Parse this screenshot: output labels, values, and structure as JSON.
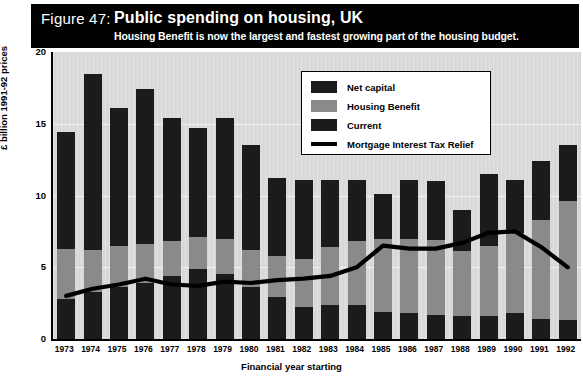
{
  "header": {
    "figure_label": "Figure 47:",
    "title": "Public spending on housing, UK",
    "subtitle": "Housing Benefit is now the largest and fastest growing part of the housing budget."
  },
  "legend": {
    "items": [
      {
        "label": "Net capital",
        "type": "swatch",
        "color": "#1b1b1b"
      },
      {
        "label": "Housing Benefit",
        "type": "swatch",
        "color": "#8a8a8a"
      },
      {
        "label": "Current",
        "type": "swatch",
        "color": "#1b1b1b"
      },
      {
        "label": "Mortgage Interest Tax Relief",
        "type": "line",
        "color": "#000000"
      }
    ]
  },
  "chart_data": {
    "type": "bar",
    "subtype": "stacked-bar-with-line-overlay",
    "title": "Public spending on housing, UK",
    "subtitle": "Housing Benefit is now the largest and fastest growing part of the housing budget.",
    "xlabel": "Financial year starting",
    "ylabel": "£ billion 1991-92 prices",
    "ylim": [
      0,
      20
    ],
    "yticks": [
      0,
      5,
      10,
      15,
      20
    ],
    "grid": true,
    "legend_position": "top-right-inside",
    "categories": [
      "1973",
      "1974",
      "1975",
      "1976",
      "1977",
      "1978",
      "1979",
      "1980",
      "1981",
      "1982",
      "1983",
      "1984",
      "1985",
      "1986",
      "1987",
      "1988",
      "1989",
      "1990",
      "1991",
      "1992"
    ],
    "series": [
      {
        "name": "Current",
        "color": "#1b1b1b",
        "values": [
          2.8,
          3.3,
          3.6,
          3.9,
          4.4,
          4.9,
          4.5,
          3.6,
          2.9,
          2.2,
          2.4,
          2.4,
          1.9,
          1.8,
          1.7,
          1.6,
          1.6,
          1.8,
          1.4,
          1.3
        ]
      },
      {
        "name": "Housing Benefit",
        "color": "#8a8a8a",
        "values": [
          3.5,
          2.9,
          2.9,
          2.7,
          2.4,
          2.2,
          2.5,
          2.6,
          2.9,
          3.4,
          4.0,
          4.4,
          5.1,
          5.2,
          5.2,
          4.5,
          4.9,
          5.6,
          6.9,
          8.3
        ]
      },
      {
        "name": "Net capital",
        "color": "#1b1b1b",
        "values": [
          8.1,
          12.3,
          9.6,
          10.8,
          8.6,
          7.6,
          8.4,
          7.3,
          5.4,
          5.5,
          4.7,
          4.3,
          3.1,
          4.1,
          4.1,
          2.9,
          5.0,
          3.7,
          4.1,
          3.9
        ]
      }
    ],
    "totals": [
      14.4,
      18.5,
      16.1,
      17.4,
      15.4,
      14.7,
      15.4,
      13.5,
      11.2,
      11.1,
      11.1,
      11.1,
      10.1,
      11.1,
      11.0,
      9.0,
      11.5,
      11.1,
      12.4,
      13.5
    ],
    "overlay_line": {
      "name": "Mortgage Interest Tax Relief",
      "color": "#000000",
      "x": [
        "1973",
        "1974",
        "1975",
        "1976",
        "1977",
        "1978",
        "1979",
        "1980",
        "1981",
        "1982",
        "1983",
        "1984",
        "1985",
        "1986",
        "1987",
        "1988",
        "1989",
        "1990",
        "1991",
        "1992"
      ],
      "values": [
        3.0,
        3.5,
        3.8,
        4.2,
        3.8,
        3.7,
        4.0,
        3.9,
        4.1,
        4.2,
        4.4,
        5.0,
        6.5,
        6.3,
        6.3,
        6.7,
        7.4,
        7.5,
        6.4,
        5.0
      ]
    }
  },
  "axes": {
    "yticks": [
      "20",
      "15",
      "10",
      "5",
      "0"
    ],
    "xticks": [
      "1973",
      "1974",
      "1975",
      "1976",
      "1977",
      "1978",
      "1979",
      "1980",
      "1981",
      "1982",
      "1983",
      "1984",
      "1985",
      "1986",
      "1987",
      "1988",
      "1989",
      "1990",
      "1991",
      "1992"
    ],
    "ylabel": "£ billion 1991-92 prices",
    "xlabel": "Financial year starting"
  },
  "colors": {
    "plot_background": "#d8d8d8",
    "banner_background": "#000000",
    "dark_segment": "#1b1b1b",
    "mid_segment": "#8a8a8a",
    "line": "#000000"
  }
}
